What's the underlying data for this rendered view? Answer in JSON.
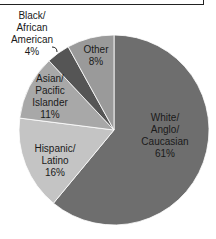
{
  "chart_data": {
    "type": "pie",
    "title": "",
    "categories": [
      "White/Anglo/Caucasian",
      "Hispanic/Latino",
      "Asian/Pacific Islander",
      "Black/African American",
      "Other"
    ],
    "values": [
      61,
      16,
      11,
      4,
      8
    ],
    "unit": "%",
    "colors": [
      "#6e6e6e",
      "#c4c4c4",
      "#a8a8a8",
      "#555555",
      "#9a9a9a"
    ],
    "labels": [
      {
        "text": "White/\nAnglo/\nCaucasian\n61%"
      },
      {
        "text": "Hispanic/\nLatino\n16%"
      },
      {
        "text": "Asian/\nPacific\nIslander\n11%"
      },
      {
        "text": "Black/\nAfrican\nAmerican\n4%"
      },
      {
        "text": "Other\n8%"
      }
    ],
    "legend": "none (data labels on slices)"
  }
}
